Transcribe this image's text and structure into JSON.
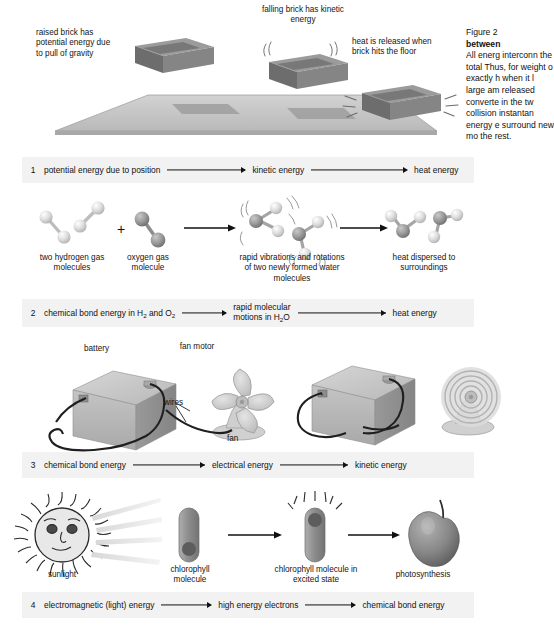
{
  "figure": {
    "caption_line1": "Figure 2",
    "caption_bold": "between",
    "caption_body": "All energ interconn the total Thus, for weight o exactly h when it l large am released converte in the tw collision instantan energy e surround new mo the rest."
  },
  "panel1": {
    "label_raised_brick": "raised brick has potential energy due to pull of gravity",
    "label_falling_brick": "falling brick has kinetic energy",
    "label_heat_released": "heat is released when brick hits the floor"
  },
  "panel2": {
    "label_hydrogen": "two hydrogen gas molecules",
    "plus": "+",
    "label_oxygen": "oxygen gas molecule",
    "label_vibrations": "rapid vibrations and rotations of two newly formed water molecules",
    "label_dispersed": "heat dispersed to surroundings"
  },
  "panel3": {
    "label_battery": "battery",
    "label_fan_motor": "fan motor",
    "label_wires": "wires",
    "label_fan": "fan"
  },
  "panel4": {
    "label_sunlight": "sunlight",
    "label_chlorophyll": "chlorophyll molecule",
    "label_chlorophyll_excited": "chlorophyll molecule in excited state",
    "label_photosynthesis": "photosynthesis"
  },
  "equations": [
    {
      "number": "1",
      "terms": [
        "potential energy due to position",
        "kinetic energy",
        "heat energy"
      ]
    },
    {
      "number": "2",
      "terms": [
        "chemical bond energy in H2 and O2",
        "rapid molecular motions in H2O",
        "heat energy"
      ]
    },
    {
      "number": "3",
      "terms": [
        "chemical bond energy",
        "electrical energy",
        "kinetic energy"
      ]
    },
    {
      "number": "4",
      "terms": [
        "electromagnetic (light) energy",
        "high energy electrons",
        "chemical bond energy"
      ]
    }
  ],
  "colors": {
    "band": "#f2f2f2",
    "ink": "#111111",
    "brick_top": "#8e8e8e",
    "brick_side": "#6f6f6f",
    "floor": "#c9c9c9",
    "battery": "#b5b5b5",
    "atom_light": "#e2e2e2",
    "atom_dark": "#8a8a8a",
    "apple": "#808080"
  }
}
